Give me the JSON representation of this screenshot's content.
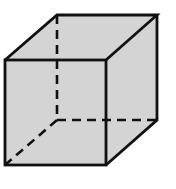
{
  "figure": {
    "type": "cube-wireframe",
    "fill_color": "#d4d4d4",
    "stroke_color": "#111111",
    "vertices": {
      "front_top_left": [
        5,
        60
      ],
      "front_top_right": [
        106,
        60
      ],
      "front_bottom_left": [
        5,
        165
      ],
      "front_bottom_right": [
        106,
        165
      ],
      "back_top_left": [
        57,
        15
      ],
      "back_top_right": [
        157,
        15
      ],
      "back_bottom_left": [
        57,
        120
      ],
      "back_bottom_right": [
        157,
        120
      ]
    },
    "hidden_edges": [
      "back_top_left-back_bottom_left",
      "back_bottom_left-back_bottom_right",
      "back_bottom_left-front_bottom_left"
    ]
  }
}
